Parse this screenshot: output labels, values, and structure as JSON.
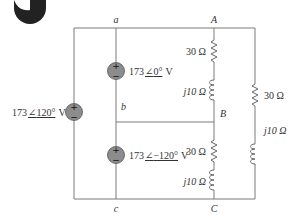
{
  "logo": {
    "icon": "publisher-logo-icon"
  },
  "nodes": {
    "a": "a",
    "b": "b",
    "c": "c",
    "A": "A",
    "B": "B",
    "C": "C"
  },
  "sources": [
    {
      "id": "left",
      "magnitude": "173",
      "angle": "120°",
      "unit": "V",
      "plus": "+",
      "minus": "−"
    },
    {
      "id": "top",
      "magnitude": "173",
      "angle": "0°",
      "unit": "V",
      "plus": "+",
      "minus": "−"
    },
    {
      "id": "bottom",
      "magnitude": "173",
      "angle": "−120°",
      "unit": "V",
      "plus": "+",
      "minus": "−"
    }
  ],
  "impedances": {
    "AB_resistor": "30 Ω",
    "AB_inductor": "j10 Ω",
    "BC_resistor": "30 Ω",
    "BC_inductor": "j10 Ω",
    "CA_resistor": "30 Ω",
    "CA_inductor": "j10 Ω"
  },
  "colors": {
    "wire": "#7a7a7a",
    "source_fill": "#8c8c8c",
    "text": "#333333"
  }
}
